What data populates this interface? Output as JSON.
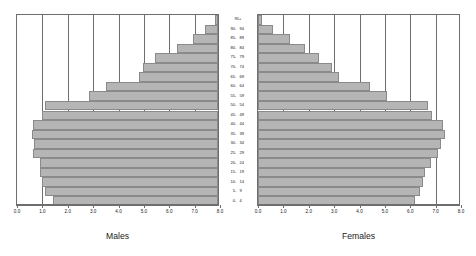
{
  "chart_data": {
    "type": "bar",
    "title": "",
    "subtitle": "",
    "orientation": "horizontal",
    "layout": "population-pyramid",
    "xlabel": "",
    "ylabel": "",
    "grid": true,
    "legend_position": "below-panels",
    "categories": [
      "0 - 4",
      "5 - 9",
      "10 - 14",
      "15 - 19",
      "20 - 24",
      "25 - 29",
      "30 - 34",
      "35 - 39",
      "40 - 44",
      "45 - 49",
      "50 - 54",
      "55 - 59",
      "60 - 64",
      "65 - 69",
      "70 - 74",
      "75 - 79",
      "80 - 84",
      "85 - 89",
      "90 - 94",
      "95+"
    ],
    "age_labels": [
      {
        "low": "0-",
        "high": "4",
        "single": ""
      },
      {
        "low": "5-",
        "high": "9",
        "single": ""
      },
      {
        "low": "10-",
        "high": "14",
        "single": ""
      },
      {
        "low": "15-",
        "high": "19",
        "single": ""
      },
      {
        "low": "20-",
        "high": "24",
        "single": ""
      },
      {
        "low": "25-",
        "high": "29",
        "single": ""
      },
      {
        "low": "30-",
        "high": "34",
        "single": ""
      },
      {
        "low": "35-",
        "high": "39",
        "single": ""
      },
      {
        "low": "40-",
        "high": "44",
        "single": ""
      },
      {
        "low": "45-",
        "high": "49",
        "single": ""
      },
      {
        "low": "50-",
        "high": "54",
        "single": ""
      },
      {
        "low": "55-",
        "high": "59",
        "single": ""
      },
      {
        "low": "60-",
        "high": "64",
        "single": ""
      },
      {
        "low": "65-",
        "high": "69",
        "single": ""
      },
      {
        "low": "70-",
        "high": "74",
        "single": ""
      },
      {
        "low": "75-",
        "high": "79",
        "single": ""
      },
      {
        "low": "80-",
        "high": "84",
        "single": ""
      },
      {
        "low": "85-",
        "high": "89",
        "single": ""
      },
      {
        "low": "90-",
        "high": "94",
        "single": ""
      },
      {
        "low": "",
        "high": "",
        "single": "95+"
      }
    ],
    "series": [
      {
        "name": "Males",
        "side": "left",
        "axis_direction": "right-to-left",
        "values": [
          6.5,
          6.8,
          6.95,
          7.0,
          7.0,
          7.3,
          7.25,
          7.35,
          7.3,
          6.95,
          6.8,
          5.1,
          4.4,
          3.1,
          2.95,
          2.5,
          1.6,
          1.0,
          0.5,
          0.12
        ]
      },
      {
        "name": "Females",
        "side": "right",
        "axis_direction": "left-to-right",
        "values": [
          6.2,
          6.4,
          6.5,
          6.6,
          6.8,
          7.1,
          7.2,
          7.35,
          7.3,
          6.85,
          6.7,
          5.1,
          4.4,
          3.2,
          2.9,
          2.4,
          1.85,
          1.25,
          0.6,
          0.15
        ]
      }
    ],
    "xlim": [
      0,
      8
    ],
    "xticks": [
      0.0,
      1.0,
      2.0,
      3.0,
      4.0,
      5.0,
      6.0,
      7.0,
      8.0
    ],
    "xticklabels_males": [
      "8.0",
      "7.0",
      "6.0",
      "5.0",
      "4.0",
      "3.0",
      "2.0",
      "1.0",
      "0.0"
    ],
    "xticklabels_females": [
      "0.0",
      "1.0",
      "2.0",
      "3.0",
      "4.0",
      "5.0",
      "6.0",
      "7.0",
      "8.0"
    ],
    "colors": {
      "bar_fill": "#b5b5b5",
      "bar_stroke": "#8a8a8a",
      "gridline": "#6e6e6e",
      "axis": "#6e6e6e",
      "text": "#1a1a1a",
      "background": "#ffffff"
    }
  },
  "captions": {
    "males": "Males",
    "females": "Females"
  }
}
